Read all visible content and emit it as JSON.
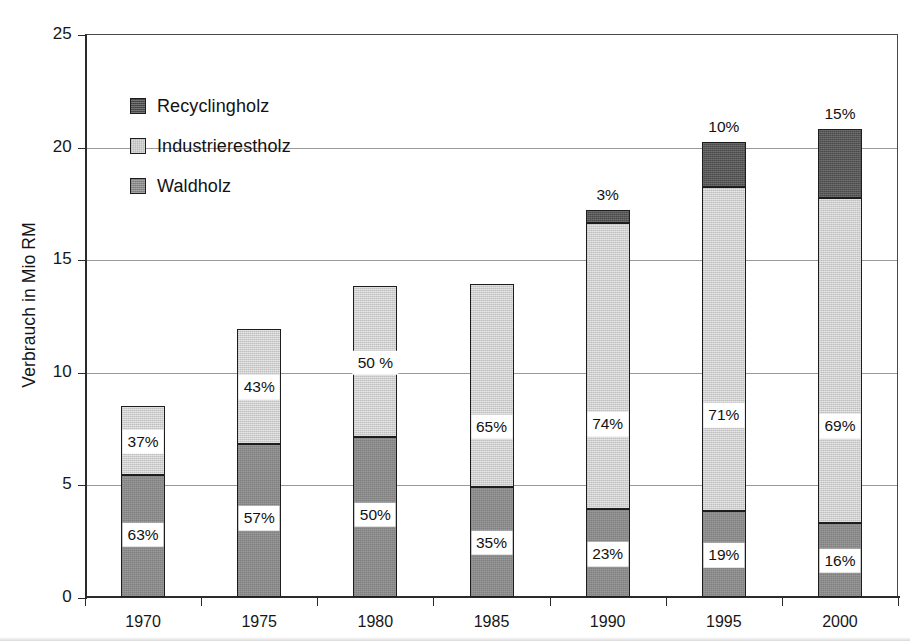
{
  "chart_data": {
    "type": "bar",
    "subtype": "stacked-bar",
    "title": "",
    "xlabel": "",
    "ylabel": "Verbrauch in Mio RM",
    "ylim": [
      0,
      25
    ],
    "yticks": [
      0,
      5,
      10,
      15,
      20,
      25
    ],
    "ytick_labels": [
      "0",
      "5",
      "10",
      "15",
      "20",
      "25"
    ],
    "grid": true,
    "grid_axis": "y",
    "legend_position": "upper-left-inside",
    "categories": [
      "1970",
      "1975",
      "1980",
      "1985",
      "1990",
      "1995",
      "2000"
    ],
    "series": [
      {
        "name": "Waldholz",
        "color": "#8a8a8a",
        "values": [
          5.4,
          6.8,
          7.1,
          4.9,
          3.9,
          3.8,
          3.3
        ],
        "percent_labels": [
          "63%",
          "57%",
          "50%",
          "35%",
          "23%",
          "19%",
          "16%"
        ]
      },
      {
        "name": "Industrierestholz",
        "color": "#cfcfcf",
        "values": [
          3.1,
          5.1,
          6.7,
          9.0,
          12.7,
          14.4,
          14.4
        ],
        "percent_labels": [
          "37%",
          "43%",
          "50 %",
          "65%",
          "74%",
          "71%",
          "69%"
        ]
      },
      {
        "name": "Recyclingholz",
        "color": "#4a4a4a",
        "values": [
          0,
          0,
          0,
          0,
          0.6,
          2.0,
          3.1
        ],
        "percent_labels": [
          "",
          "",
          "",
          "",
          "3%",
          "10%",
          "15%"
        ]
      }
    ],
    "totals": [
      8.5,
      11.9,
      13.8,
      13.9,
      17.2,
      20.2,
      20.8
    ]
  },
  "legend": {
    "items": [
      {
        "label": "Recyclingholz",
        "color": "#4a4a4a",
        "swatch": "recyclingholz-swatch"
      },
      {
        "label": "Industrierestholz",
        "color": "#cfcfcf",
        "swatch": "industrierestholz-swatch"
      },
      {
        "label": "Waldholz",
        "color": "#8a8a8a",
        "swatch": "waldholz-swatch"
      }
    ]
  },
  "axes": {
    "y_title": "Verbrauch in Mio RM",
    "y_ticks": [
      "0",
      "5",
      "10",
      "15",
      "20",
      "25"
    ],
    "x_ticks": [
      "1970",
      "1975",
      "1980",
      "1985",
      "1990",
      "1995",
      "2000"
    ]
  }
}
